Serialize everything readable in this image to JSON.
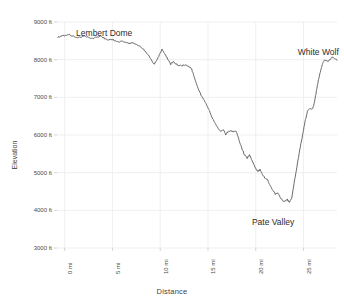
{
  "chart_data": {
    "type": "line",
    "title": "",
    "xlabel": "Distance",
    "ylabel": "Elevation",
    "xlim": [
      -0.8,
      28.5
    ],
    "ylim": [
      3000,
      9000
    ],
    "grid": true,
    "legend": "none",
    "line_color": "#5a5a5a",
    "background_color": "#ffffff",
    "grid_color": "#ebebeb",
    "xtick_values": [
      0,
      5,
      10,
      15,
      20,
      25
    ],
    "xtick_labels": [
      "0 mi",
      "5 mi",
      "10 mi",
      "15 mi",
      "20 mi",
      "25 mi"
    ],
    "ytick_values": [
      3000,
      4000,
      5000,
      6000,
      7000,
      8000,
      9000
    ],
    "ytick_labels": [
      "3000 ft",
      "4000 ft",
      "5000 ft",
      "6000 ft",
      "7000 ft",
      "8000 ft",
      "9000 ft"
    ],
    "annotations": [
      {
        "text": "Lembert Dome",
        "x": 1.2,
        "y": 8850
      },
      {
        "text": "Pate Valley",
        "x": 19.6,
        "y": 3820
      },
      {
        "text": "White Wolf",
        "x": 24.4,
        "y": 8330
      }
    ],
    "series": [
      {
        "name": "Elevation profile",
        "x": [
          -0.6,
          -0.2,
          0.3,
          0.8,
          1.2,
          1.6,
          2.0,
          2.4,
          2.8,
          3.2,
          3.6,
          4.0,
          4.4,
          4.8,
          5.2,
          5.6,
          6.0,
          6.4,
          6.8,
          7.2,
          7.6,
          8.0,
          8.4,
          8.8,
          9.2,
          9.6,
          10.0,
          10.4,
          10.8,
          11.2,
          11.6,
          12.0,
          12.4,
          12.8,
          13.2,
          13.6,
          14.0,
          14.4,
          14.8,
          15.2,
          15.6,
          16.0,
          16.4,
          16.8,
          17.2,
          17.6,
          18.0,
          18.4,
          18.8,
          19.2,
          19.6,
          20.0,
          20.4,
          20.8,
          21.2,
          21.6,
          22.0,
          22.4,
          22.8,
          23.2,
          23.6,
          24.0,
          24.4,
          24.8,
          25.2,
          25.6,
          26.0,
          26.4,
          26.8,
          27.2,
          27.6,
          28.0,
          28.4
        ],
        "y": [
          8600,
          8620,
          8640,
          8660,
          8640,
          8600,
          8560,
          8580,
          8600,
          8560,
          8540,
          8570,
          8600,
          8560,
          8500,
          8480,
          8500,
          8460,
          8430,
          8440,
          8420,
          8380,
          8300,
          8200,
          8060,
          7900,
          8050,
          8250,
          8120,
          7980,
          7880,
          7920,
          7860,
          7840,
          7830,
          7840,
          7800,
          7700,
          7400,
          7150,
          6950,
          6800,
          6620,
          6400,
          6300,
          6120,
          6050,
          6150,
          6000,
          6080,
          6100,
          6080,
          5800,
          5550,
          5400,
          5460,
          5300,
          5120,
          5000,
          5050,
          4900,
          4820,
          4780,
          4620,
          4500,
          4400,
          4420,
          4300,
          4220,
          4300,
          4700,
          5400,
          6000
        ]
      }
    ],
    "series_full": {
      "note": "full resolution polyline points in plot-pixel space",
      "points": "generated"
    }
  },
  "axis_titles": {
    "x": "Distance",
    "y": "Elevation"
  }
}
